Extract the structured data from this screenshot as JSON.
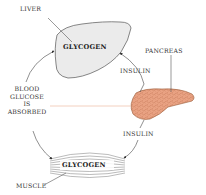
{
  "labels": {
    "liver": "LIVER",
    "liver_glycogen": "GLYCOGEN",
    "pancreas": "PANCREAS",
    "insulin_top": "INSULIN",
    "insulin_bottom": "INSULIN",
    "blood_glucose_line1": "BLOOD",
    "blood_glucose_line2": "GLUCOSE",
    "blood_glucose_line3": "IS",
    "blood_glucose_line4": "ABSORBED",
    "muscle_glycogen": "GLYCOGEN",
    "muscle": "MUSCLE"
  },
  "colors": {
    "liver_fill": "#ececec",
    "pancreas_fill": "#e8a07c",
    "pancreas_cell": "#c97a5a",
    "glucose_line": "#f0c8b4",
    "arrow": "#444444"
  }
}
